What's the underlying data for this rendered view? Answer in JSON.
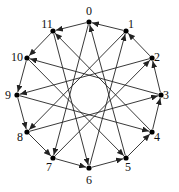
{
  "diagram": {
    "title": "",
    "nodes": [
      {
        "id": "0",
        "x": 89,
        "y": 22,
        "lx": 89,
        "ly": 15
      },
      {
        "id": "1",
        "x": 126,
        "y": 31,
        "lx": 131,
        "ly": 28
      },
      {
        "id": "2",
        "x": 152,
        "y": 58,
        "lx": 157,
        "ly": 61
      },
      {
        "id": "3",
        "x": 161,
        "y": 95,
        "lx": 166,
        "ly": 99
      },
      {
        "id": "4",
        "x": 152,
        "y": 132,
        "lx": 157,
        "ly": 141
      },
      {
        "id": "5",
        "x": 126,
        "y": 158,
        "lx": 128,
        "ly": 171
      },
      {
        "id": "6",
        "x": 89,
        "y": 168,
        "lx": 89,
        "ly": 184
      },
      {
        "id": "7",
        "x": 53,
        "y": 158,
        "lx": 49,
        "ly": 171
      },
      {
        "id": "8",
        "x": 27,
        "y": 132,
        "lx": 20,
        "ly": 141
      },
      {
        "id": "9",
        "x": 17,
        "y": 95,
        "lx": 8,
        "ly": 99
      },
      {
        "id": "10",
        "x": 27,
        "y": 58,
        "lx": 17,
        "ly": 61
      },
      {
        "id": "11",
        "x": 53,
        "y": 31,
        "lx": 47,
        "ly": 28
      }
    ],
    "edges": [
      [
        1,
        0
      ],
      [
        2,
        1
      ],
      [
        3,
        2
      ],
      [
        4,
        3
      ],
      [
        5,
        4
      ],
      [
        6,
        5
      ],
      [
        7,
        6
      ],
      [
        8,
        7
      ],
      [
        9,
        8
      ],
      [
        10,
        9
      ],
      [
        11,
        10
      ],
      [
        0,
        11
      ],
      [
        0,
        7
      ],
      [
        1,
        8
      ],
      [
        2,
        9
      ],
      [
        3,
        10
      ],
      [
        4,
        11
      ],
      [
        5,
        0
      ],
      [
        6,
        1
      ],
      [
        7,
        2
      ],
      [
        8,
        3
      ],
      [
        9,
        4
      ],
      [
        10,
        5
      ],
      [
        11,
        6
      ]
    ],
    "center_circle": {
      "cx": 89,
      "cy": 95,
      "r": 18
    }
  }
}
